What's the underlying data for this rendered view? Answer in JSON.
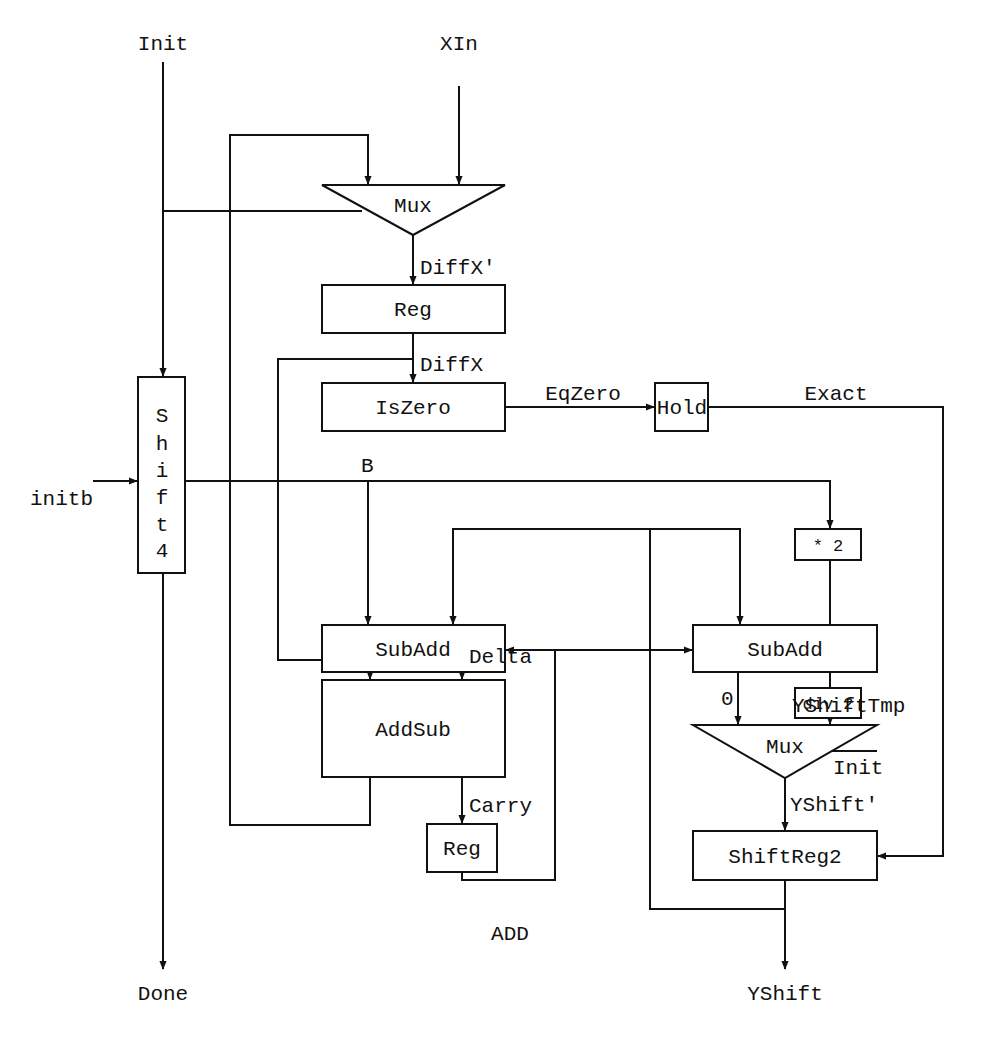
{
  "diagram": {
    "signals": {
      "init_in": "Init",
      "xin": "XIn",
      "diffx_prime": "DiffX'",
      "diffx": "DiffX",
      "eqzero": "EqZero",
      "exact": "Exact",
      "initb": "initb",
      "b": "B",
      "delta": "Delta",
      "carry": "Carry",
      "add": "ADD",
      "zero": "0",
      "yshifttmp": "YShiftTmp",
      "init_mux2": "Init",
      "yshift_prime": "YShift'",
      "done": "Done",
      "yshift": "YShift"
    },
    "blocks": {
      "mux_top": "Mux",
      "reg_top": "Reg",
      "iszero": "IsZero",
      "hold": "Hold",
      "shift4_chars": [
        "S",
        "h",
        "i",
        "f",
        "t",
        "4"
      ],
      "times2": "* 2",
      "subadd_left": "SubAdd",
      "subadd_right": "SubAdd",
      "div2": "div 2",
      "addsub": "AddSub",
      "mux_bottom": "Mux",
      "reg_bottom": "Reg",
      "shiftreg2": "ShiftReg2"
    }
  }
}
